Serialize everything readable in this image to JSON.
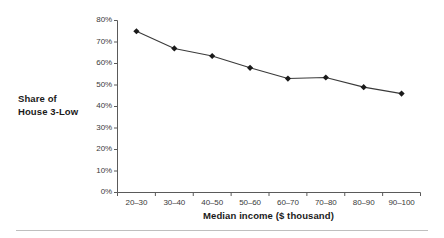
{
  "chart_data": {
    "type": "line",
    "title": "",
    "xlabel": "Median income ($ thousand)",
    "ylabel": "Share of House 3-Low",
    "ylabel_lines": [
      "Share of",
      "House 3-Low"
    ],
    "categories": [
      "20–30",
      "30–40",
      "40–50",
      "50–60",
      "60–70",
      "70–80",
      "80–90",
      "90–100"
    ],
    "values": [
      0.75,
      0.67,
      0.635,
      0.58,
      0.53,
      0.535,
      0.49,
      0.46
    ],
    "value_labels": [
      "75%",
      "67%",
      "63.5%",
      "58%",
      "53%",
      "53.5%",
      "49%",
      "46%"
    ],
    "ylim": [
      0,
      0.8
    ],
    "ytick_labels": [
      "0%",
      "10%",
      "20%",
      "30%",
      "40%",
      "50%",
      "60%",
      "70%",
      "80%"
    ],
    "ytick_values": [
      0,
      0.1,
      0.2,
      0.3,
      0.4,
      0.5,
      0.6,
      0.7,
      0.8
    ],
    "grid": false,
    "legend": false,
    "legend_position": "none",
    "series": [
      {
        "name": "Share of House 3-Low",
        "values": [
          0.75,
          0.67,
          0.635,
          0.58,
          0.53,
          0.535,
          0.49,
          0.46
        ],
        "marker": "diamond",
        "color": "#1a1a1a"
      }
    ],
    "colors": {
      "line": "#3a3a3a",
      "marker": "#1a1a1a",
      "axis": "#5a5a5a",
      "text": "#1a1a1a",
      "tick_text": "#3a3a3a",
      "background": "#ffffff",
      "rule": "#bfbfbf"
    }
  }
}
